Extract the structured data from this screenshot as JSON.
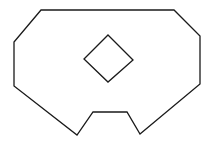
{
  "diagram": {
    "stroke_color": "#1a1a1a",
    "background": "#ffffff",
    "outer_shape": {
      "name": "outer-polygon",
      "points": "41,10 174,10 200,36 200,84 140,134 127,112 93,112 77,135 14,86 14,42"
    },
    "inner_shape": {
      "name": "inner-diamond",
      "points": "108,35 133,60 108,82 84,59"
    }
  }
}
